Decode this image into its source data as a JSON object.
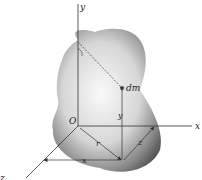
{
  "diagram": {
    "labels": {
      "y_axis": "y",
      "x_axis": "x",
      "origin": "O",
      "mass_element": "dm",
      "y_distance": "y",
      "r_distance": "r",
      "z_distance_right": "z",
      "x_distance_bottom": "x",
      "z_axis": "z"
    },
    "colors": {
      "body_light": "#f4f4f4",
      "body_dark": "#5a5a5a",
      "line": "#333333"
    }
  }
}
